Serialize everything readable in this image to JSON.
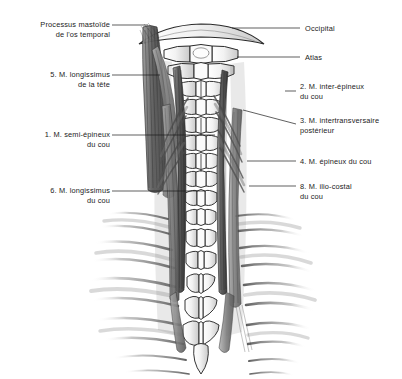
{
  "figure": {
    "background_color": "#ffffff",
    "ink_color": "#1b1b1b",
    "width": 402,
    "height": 379
  },
  "labels": {
    "left": [
      {
        "id": "processus-mastoide",
        "line1": "Processus mastoïde",
        "line2": "de l'os temporal",
        "x": 18,
        "y": 20,
        "width": 92,
        "leader": {
          "x1": 112,
          "y1": 25,
          "x2": 148,
          "y2": 25
        }
      },
      {
        "id": "longissimus-tete",
        "line1": "5. M. longissimus",
        "line2": "de la tête",
        "x": 18,
        "y": 70,
        "width": 92,
        "leader": {
          "x1": 112,
          "y1": 75,
          "x2": 160,
          "y2": 75
        }
      },
      {
        "id": "semi-epineux-du-cou",
        "line1": "1. M. semi-épineux",
        "line2": "du cou",
        "x": 12,
        "y": 130,
        "width": 98,
        "leader": {
          "x1": 112,
          "y1": 135,
          "x2": 215,
          "y2": 135
        }
      },
      {
        "id": "longissimus-du-cou",
        "line1": "6. M. longissimus",
        "line2": "du cou",
        "x": 18,
        "y": 186,
        "width": 92,
        "leader": {
          "x1": 112,
          "y1": 191,
          "x2": 205,
          "y2": 191
        }
      }
    ],
    "right": [
      {
        "id": "occipital",
        "line1": "Occipital",
        "line2": "",
        "x": 305,
        "y": 24,
        "leader": {
          "x1": 232,
          "y1": 28,
          "x2": 300,
          "y2": 28
        }
      },
      {
        "id": "atlas",
        "line1": "Atlas",
        "line2": "",
        "x": 305,
        "y": 53,
        "leader": {
          "x1": 237,
          "y1": 57,
          "x2": 300,
          "y2": 57
        }
      },
      {
        "id": "inter-epineux-du-cou",
        "line1": "2. M. inter-épineux",
        "line2": "du cou",
        "x": 300,
        "y": 82,
        "leader": {
          "x1": 285,
          "y1": 91,
          "x2": 296,
          "y2": 91
        }
      },
      {
        "id": "intertransversaire-posterieur",
        "line1": "3. M. intertransversaire",
        "line2": "postérieur",
        "x": 300,
        "y": 116,
        "leader": {
          "x1": 243,
          "y1": 110,
          "x2": 296,
          "y2": 124
        }
      },
      {
        "id": "epineux-du-cou",
        "line1": "4. M. épineux du cou",
        "line2": "",
        "x": 300,
        "y": 157,
        "leader": {
          "x1": 247,
          "y1": 161,
          "x2": 296,
          "y2": 161
        }
      },
      {
        "id": "ilio-costal-du-cou",
        "line1": "8. M. ilio-costal",
        "line2": "du cou",
        "x": 300,
        "y": 182,
        "leader": {
          "x1": 249,
          "y1": 186,
          "x2": 296,
          "y2": 186
        }
      }
    ]
  },
  "anatomy": {
    "structures": [
      "occipital-bone",
      "atlas-vertebra",
      "cervical-vertebrae",
      "thoracic-vertebrae",
      "ribs",
      "longissimus-capitis-muscle",
      "semispinalis-cervicis-muscle",
      "longissimus-cervicis-muscle",
      "iliocostalis-cervicis-muscle",
      "spinalis-cervicis-muscle",
      "interspinales-cervicis-muscle",
      "intertransversarii-posteriores-muscle"
    ],
    "view": "posterior",
    "style": "pencil-shaded-medical-illustration"
  }
}
